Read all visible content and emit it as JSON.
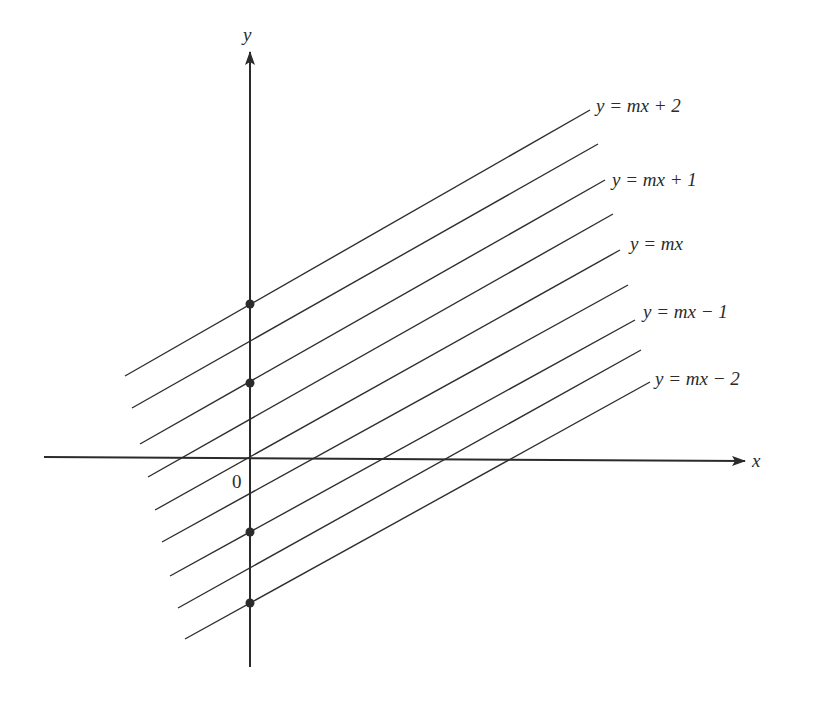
{
  "diagram": {
    "colors": {
      "ink": "#2b2b2b",
      "background": "#ffffff"
    },
    "axes": {
      "x_label": "x",
      "y_label": "y",
      "origin_label": "0",
      "origin_px": [
        250,
        458
      ],
      "x_axis": {
        "from": [
          44,
          457
        ],
        "to": [
          745,
          461
        ]
      },
      "y_axis": {
        "from": [
          250,
          667
        ],
        "to": [
          250,
          52
        ]
      }
    },
    "lines": [
      {
        "id": "l1",
        "from": [
          125,
          376
        ],
        "to": [
          590,
          110
        ],
        "label": "y = mx + 2",
        "intercept": 2
      },
      {
        "id": "l2",
        "from": [
          132,
          408
        ],
        "to": [
          598,
          144
        ],
        "label": "",
        "intercept": 1.5
      },
      {
        "id": "l3",
        "from": [
          140,
          444
        ],
        "to": [
          605,
          180
        ],
        "label": "y = mx + 1",
        "intercept": 1
      },
      {
        "id": "l4",
        "from": [
          148,
          477
        ],
        "to": [
          613,
          214
        ],
        "label": "",
        "intercept": 0.5
      },
      {
        "id": "l5",
        "from": [
          155,
          510
        ],
        "to": [
          620,
          250
        ],
        "label": "y = mx",
        "intercept": 0
      },
      {
        "id": "l6",
        "from": [
          162,
          542
        ],
        "to": [
          628,
          285
        ],
        "label": "",
        "intercept": -0.5
      },
      {
        "id": "l7",
        "from": [
          170,
          576
        ],
        "to": [
          635,
          320
        ],
        "label": "y = mx − 1",
        "intercept": -1
      },
      {
        "id": "l8",
        "from": [
          178,
          608
        ],
        "to": [
          641,
          350
        ],
        "label": "",
        "intercept": -1.5
      },
      {
        "id": "l9",
        "from": [
          185,
          639
        ],
        "to": [
          650,
          382
        ],
        "label": "y = mx − 2",
        "intercept": -2
      }
    ],
    "labels": {
      "l1": "y = mx + 2",
      "l3": "y = mx + 1",
      "l5": "y = mx",
      "l7": "y = mx − 1",
      "l9": "y = mx − 2"
    },
    "intercept_dots": [
      {
        "for": "y = mx + 2",
        "px": [
          250,
          304
        ]
      },
      {
        "for": "y = mx + 1",
        "px": [
          250,
          383
        ]
      },
      {
        "for": "y = mx − 1",
        "px": [
          250,
          532
        ]
      },
      {
        "for": "y = mx − 2",
        "px": [
          250,
          603
        ]
      }
    ]
  }
}
